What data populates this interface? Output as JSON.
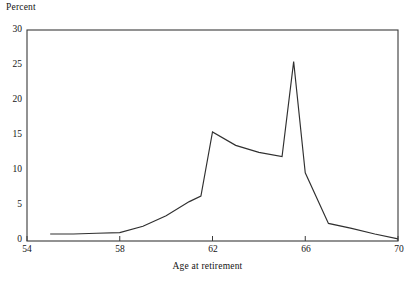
{
  "chart_data": {
    "type": "line",
    "title": "",
    "subtitle": "",
    "xlabel": "Age at retirement",
    "ylabel": "Percent",
    "xlim": [
      54,
      70
    ],
    "ylim": [
      0,
      30
    ],
    "xticks": [
      54,
      58,
      62,
      66,
      70
    ],
    "yticks": [
      0,
      5,
      10,
      15,
      20,
      25,
      30
    ],
    "grid": false,
    "legend": false,
    "legend_position": "none",
    "line_color": "#303030",
    "series": [
      {
        "name": "Share of retirements",
        "x": [
          55,
          56,
          57,
          58,
          59,
          60,
          61,
          61.5,
          62,
          63,
          64,
          65,
          65.5,
          66,
          67,
          68,
          69,
          70
        ],
        "values": [
          1.0,
          1.0,
          1.1,
          1.2,
          2.1,
          3.6,
          5.6,
          6.4,
          15.5,
          13.6,
          12.6,
          12.0,
          25.5,
          9.7,
          2.5,
          1.8,
          1.0,
          0.3
        ]
      }
    ]
  },
  "axis_titles": {
    "y": "Percent",
    "x": "Age at retirement"
  },
  "ytick_labels": [
    "30",
    "25",
    "20",
    "15",
    "10",
    "5",
    "0"
  ],
  "xtick_labels": [
    "54",
    "58",
    "62",
    "66",
    "70"
  ]
}
